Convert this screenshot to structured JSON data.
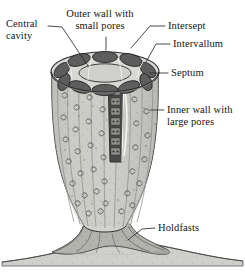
{
  "figure": {
    "palette": {
      "background": "#ffffff",
      "ink": "#141414",
      "body_fill": "#c9c9c5",
      "body_shade": "#a9a9a5",
      "chamber_dark": "#5c5c5c",
      "chamber_rim": "#d6d6d2",
      "cutaway_dark": "#4a4a4a",
      "ground_fill": "#cfcfcb",
      "leader_line": "#333333"
    }
  },
  "labels": {
    "central_cavity": {
      "line1": "Central",
      "line2": "cavity"
    },
    "outer_wall": {
      "line1": "Outer wall with",
      "line2": "small pores"
    },
    "intersept": {
      "text": "Intersept"
    },
    "intervallum": {
      "text": "Intervallum"
    },
    "septum": {
      "text": "Septum"
    },
    "inner_wall": {
      "line1": "Inner wall with",
      "line2": "large pores"
    },
    "holdfasts": {
      "text": "Holdfasts"
    }
  }
}
